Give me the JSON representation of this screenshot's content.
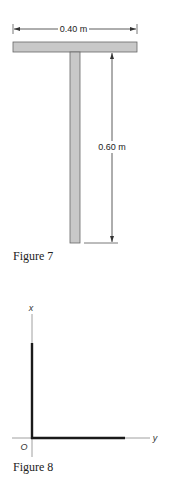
{
  "figure7": {
    "caption": "Figure 7",
    "width_dimension": "0.40 m",
    "height_dimension": "0.60 m",
    "shape": "T-shaped assembly of two slender rods",
    "fill_color": "#c8c8c8",
    "stroke_color": "#555555"
  },
  "figure8": {
    "caption": "Figure 8",
    "axis_x_label": "x",
    "axis_y_label": "y",
    "origin_label": "O",
    "shape": "L-shaped pair of rods along x and y axes",
    "rod_color": "#1a1a1a",
    "axis_color": "#777777"
  }
}
